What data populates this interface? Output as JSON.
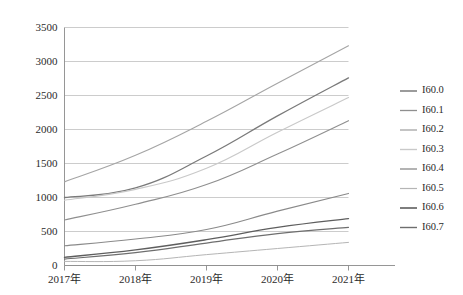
{
  "chart_data": {
    "type": "line",
    "title": "",
    "subtitle": "",
    "xlabel": "",
    "ylabel": "",
    "categories": [
      "2017年",
      "2018年",
      "2019年",
      "2020年",
      "2021年"
    ],
    "ylim": [
      0,
      3500
    ],
    "yticks": [
      0,
      500,
      1000,
      1500,
      2000,
      2500,
      3000,
      3500
    ],
    "ytick_labels": [
      "0",
      "500",
      "1000",
      "1500",
      "2000",
      "2500",
      "3000",
      "3500"
    ],
    "grid": true,
    "legend_position": "right",
    "series": [
      {
        "name": "I60.0",
        "color": "#7a7a7a",
        "width": 1.3,
        "values": [
          1000,
          1140,
          1610,
          2200,
          2760
        ]
      },
      {
        "name": "I60.1",
        "color": "#8f8f8f",
        "width": 1.1,
        "values": [
          670,
          900,
          1190,
          1640,
          2130
        ]
      },
      {
        "name": "I60.2",
        "color": "#a5a5a5",
        "width": 1.1,
        "values": [
          1230,
          1620,
          2120,
          2680,
          3230
        ]
      },
      {
        "name": "I60.3",
        "color": "#c9c9c9",
        "width": 1.2,
        "values": [
          960,
          1120,
          1430,
          1960,
          2470
        ]
      },
      {
        "name": "I60.4",
        "color": "#8a8a8a",
        "width": 1.1,
        "values": [
          290,
          390,
          530,
          800,
          1060
        ]
      },
      {
        "name": "I60.5",
        "color": "#b5b5b5",
        "width": 1.0,
        "values": [
          60,
          70,
          160,
          250,
          340
        ]
      },
      {
        "name": "I60.6",
        "color": "#5e5e5e",
        "width": 1.4,
        "values": [
          120,
          230,
          380,
          560,
          690
        ]
      },
      {
        "name": "I60.7",
        "color": "#6e6e6e",
        "width": 1.2,
        "values": [
          95,
          190,
          330,
          470,
          560
        ]
      }
    ]
  },
  "legend": {
    "items": [
      "I60.0",
      "I60.1",
      "I60.2",
      "I60.3",
      "I60.4",
      "I60.5",
      "I60.6",
      "I60.7"
    ]
  }
}
